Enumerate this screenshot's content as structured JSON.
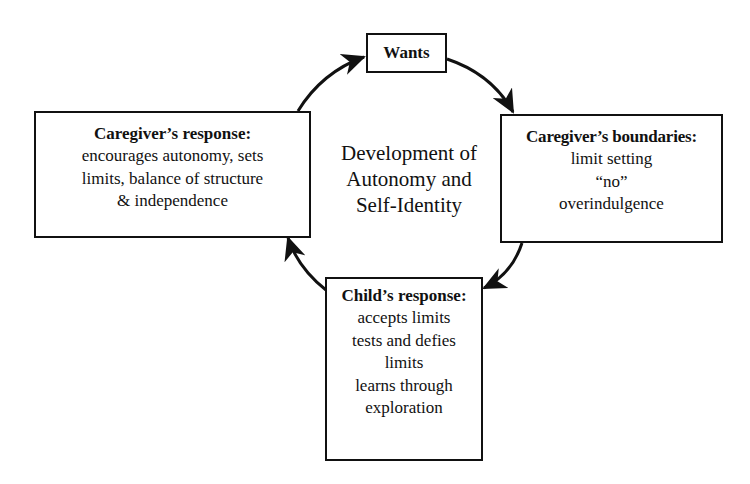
{
  "diagram": {
    "center_label": [
      "Development of",
      "Autonomy and",
      "Self-Identity"
    ],
    "nodes": {
      "wants": {
        "title": "Wants",
        "lines": []
      },
      "caregiver_boundaries": {
        "title": "Caregiver’s boundaries:",
        "lines": [
          "limit setting",
          "“no”",
          "overindulgence"
        ]
      },
      "child_response": {
        "title": "Child’s response:",
        "lines": [
          "accepts limits",
          "tests and defies",
          "limits",
          "learns through",
          "exploration"
        ]
      },
      "caregiver_response": {
        "title": "Caregiver’s response:",
        "lines": [
          "encourages autonomy, sets",
          "limits, balance of structure",
          "& independence"
        ]
      }
    },
    "edges": [
      {
        "from": "caregiver_response",
        "to": "wants"
      },
      {
        "from": "wants",
        "to": "caregiver_boundaries"
      },
      {
        "from": "caregiver_boundaries",
        "to": "child_response"
      },
      {
        "from": "child_response",
        "to": "caregiver_response"
      }
    ],
    "colors": {
      "stroke": "#111111",
      "background": "#ffffff"
    }
  }
}
